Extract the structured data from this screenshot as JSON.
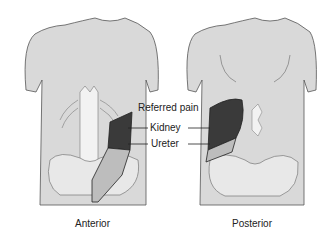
{
  "figure": {
    "labels": {
      "referred_pain": "Referred pain",
      "kidney": "Kidney",
      "ureter": "Ureter"
    },
    "captions": {
      "anterior": "Anterior",
      "posterior": "Posterior"
    },
    "colors": {
      "skin": "#d9d9d9",
      "outline": "#555555",
      "bone": "#f2f2f2",
      "referred_pain_area": "#3a3a3a",
      "ureter_area": "#bdbdbd",
      "background": "#ffffff"
    }
  }
}
